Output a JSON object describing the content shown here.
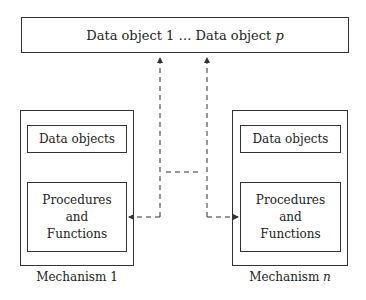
{
  "diagram": {
    "top_box": {
      "text_prefix": "Data object 1 … Data object ",
      "text_var": "p"
    },
    "mechanisms": [
      {
        "name_prefix": "Mechanism ",
        "name_var": "1",
        "data_label": "Data objects",
        "proc_line1": "Procedures",
        "proc_line2": "and",
        "proc_line3": "Functions"
      },
      {
        "name_prefix": "Mechanism ",
        "name_var": "n",
        "data_label": "Data objects",
        "proc_line1": "Procedures",
        "proc_line2": "and",
        "proc_line3": "Functions"
      }
    ],
    "connectors": {
      "style": "dashed",
      "color": "#333333"
    }
  }
}
